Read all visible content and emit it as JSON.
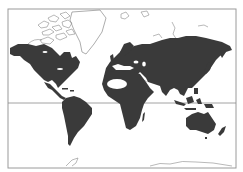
{
  "map": {
    "type": "world-map",
    "projection": "mercator",
    "colors": {
      "background": "#ffffff",
      "land_filled": "#3a3a3a",
      "land_outline": "#8a8a8a",
      "frame": "#9a9a9a",
      "equator": "#8a8a8a",
      "desert_highlight": "#ffffff"
    },
    "frame": {
      "left": 8,
      "top": 9,
      "right": 236,
      "bottom": 168
    },
    "equator_y": 103,
    "regions_filled": [
      "North America",
      "Central America",
      "South America",
      "Europe",
      "Africa",
      "Asia",
      "Indonesia",
      "Australia",
      "New Zealand",
      "Madagascar",
      "Japan",
      "Great Britain"
    ],
    "regions_outlined": [
      "Canadian Arctic Archipelago",
      "Greenland",
      "Svalbard",
      "Russian Arctic Islands",
      "Antarctica"
    ],
    "highlight": "Sahara (white oval)"
  }
}
